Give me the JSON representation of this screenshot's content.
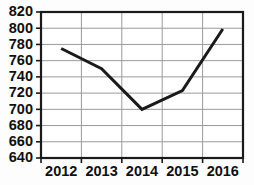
{
  "chart_data": {
    "type": "line",
    "title": "",
    "subtitle": "",
    "xlabel": "",
    "ylabel": "",
    "categories": [
      "2012",
      "2013",
      "2014",
      "2015",
      "2016"
    ],
    "x": [
      2012,
      2013,
      2014,
      2015,
      2016
    ],
    "values": [
      775,
      750,
      700,
      723,
      799
    ],
    "series": [
      {
        "name": "",
        "values": [
          775,
          750,
          700,
          723,
          799
        ]
      }
    ],
    "ylim": [
      640,
      820
    ],
    "xlim": [
      2011.5,
      2016.5
    ],
    "ytick_labels": [
      "820",
      "800",
      "780",
      "760",
      "740",
      "720",
      "700",
      "680",
      "660",
      "640"
    ],
    "ytick_values": [
      820,
      800,
      780,
      760,
      740,
      720,
      700,
      680,
      660,
      640
    ],
    "xtick_labels": [
      "2012",
      "2013",
      "2014",
      "2015",
      "2016"
    ],
    "grid": true,
    "grid_horizontal": true,
    "grid_vertical": true,
    "legend": false,
    "legend_position": "none",
    "markers": false,
    "annotations": [],
    "colors": {
      "line": "#1a1a1a",
      "grid": "#9a9a9a",
      "axis": "#1a1a1a",
      "background": "#fdfdfd",
      "text": "#101010"
    },
    "line_width": 3
  }
}
